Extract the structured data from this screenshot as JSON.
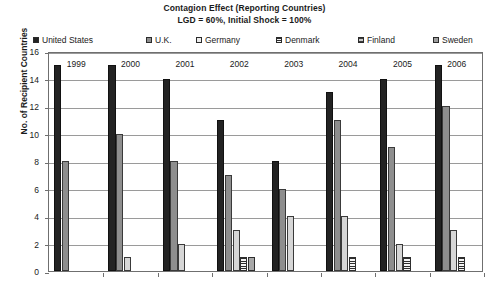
{
  "chart_data": {
    "type": "bar",
    "title": "Contagion Effect (Reporting Countries)",
    "subtitle": "LGD = 60%, Initial Shock = 100%",
    "xlabel": "",
    "ylabel": "No. of Recipient Countries",
    "ylim": [
      0,
      16
    ],
    "ytick_step": 2,
    "ytick_labels": [
      "0",
      "2",
      "4",
      "6",
      "8",
      "10",
      "12",
      "14",
      "16"
    ],
    "grid": true,
    "grid_axis": "y",
    "legend_position": "top",
    "categories": [
      "1999",
      "2000",
      "2001",
      "2002",
      "2003",
      "2004",
      "2005",
      "2006"
    ],
    "series": [
      {
        "name": "United States",
        "color": "#232323",
        "values": [
          15,
          15,
          14,
          11,
          8,
          13,
          14,
          15
        ]
      },
      {
        "name": "U.K.",
        "color": "#8e8e8e",
        "values": [
          8,
          10,
          8,
          7,
          6,
          11,
          9,
          12
        ]
      },
      {
        "name": "Germany",
        "color": "#d6d6d6",
        "values": [
          0,
          1,
          2,
          3,
          4,
          4,
          2,
          3
        ]
      },
      {
        "name": "Denmark",
        "color": "#f2f2f2",
        "values": [
          0,
          0,
          0,
          1,
          0,
          1,
          1,
          1
        ]
      },
      {
        "name": "Finland",
        "color": "#a8a8a8",
        "values": [
          0,
          0,
          0,
          1,
          0,
          0,
          0,
          0
        ]
      },
      {
        "name": "Sweden",
        "color": "#9e9e9e",
        "values": [
          0,
          0,
          0,
          0,
          0,
          0,
          0,
          0
        ]
      }
    ]
  },
  "legend": {
    "items": [
      {
        "label": "United States",
        "swatch": "sw-us",
        "offset": 0
      },
      {
        "label": "U.K.",
        "swatch": "sw-uk",
        "offset": 113
      },
      {
        "label": "Germany",
        "swatch": "sw-de",
        "offset": 163
      },
      {
        "label": "Denmark",
        "swatch": "sw-dk",
        "offset": 243
      },
      {
        "label": "Finland",
        "swatch": "sw-fi",
        "offset": 325
      },
      {
        "label": "Sweden",
        "swatch": "sw-se",
        "offset": 400
      }
    ]
  }
}
